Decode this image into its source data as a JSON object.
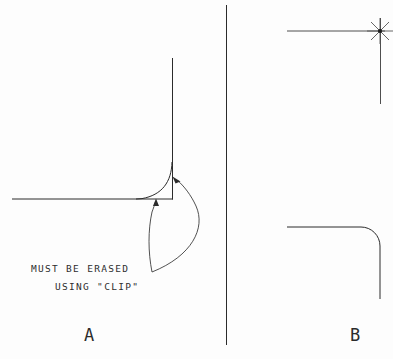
{
  "figure": {
    "background_color": "#fdfdfd",
    "line_color": "#2b2b2b",
    "width": 393,
    "height": 359
  },
  "annotation": {
    "line1": "MUST BE ERASED",
    "line2": "USING \"CLIP\"",
    "leader_count": 2
  },
  "panel_a": {
    "label": "A",
    "description": "Filleted corner with leftover overshoot segments that must be clipped",
    "horizontal_line": {
      "x1": 12,
      "y1": 199,
      "x2": 173,
      "y2": 199
    },
    "vertical_line": {
      "x1": 172,
      "y1": 58,
      "x2": 172,
      "y2": 199
    },
    "fillet_radius": 30,
    "has_overshoot": true,
    "overshoot_targets": [
      "corner-apex",
      "horizontal-tail"
    ]
  },
  "panel_b": {
    "label": "B",
    "top_description": "Two lines crossing with node snap marker at intersection",
    "bottom_description": "Clean filleted corner after clip",
    "top_horizontal_line": {
      "x1": 287,
      "y1": 31,
      "x2": 385,
      "y2": 31
    },
    "top_vertical_line": {
      "x1": 380,
      "y1": 18,
      "x2": 380,
      "y2": 104
    },
    "node_marker": {
      "cx": 380,
      "cy": 31,
      "points": 8,
      "radius": 13
    },
    "bottom_horizontal_line": {
      "x1": 287,
      "y1": 227,
      "x2": 368,
      "y2": 227
    },
    "bottom_vertical_line": {
      "x1": 380,
      "y1": 239,
      "x2": 380,
      "y2": 299
    },
    "fillet_radius": 19,
    "has_overshoot": false
  },
  "divider": {
    "name": "panel-divider",
    "x": 226,
    "y1": 5,
    "y2": 345
  }
}
